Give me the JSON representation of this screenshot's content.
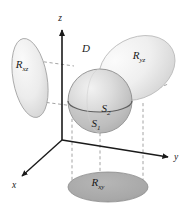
{
  "figure": {
    "title_present": false,
    "background_color": "#ffffff",
    "axes": {
      "z": {
        "label": "z",
        "label_x": 60,
        "label_y": 21,
        "arrow_dir": "up"
      },
      "y": {
        "label": "y",
        "label_x": 175,
        "label_y": 158,
        "arrow_dir": "right"
      },
      "x": {
        "label": "x",
        "label_x": 14,
        "label_y": 186,
        "arrow_dir": "down-left"
      }
    },
    "regions": [
      {
        "id": "R_xz",
        "name": "projection-xz",
        "base": "R",
        "sub": "xz",
        "label_x": 22,
        "label_y": 68,
        "fill": "#ededed",
        "stroke": "#9a9a9a",
        "cx": 30,
        "cy": 78,
        "rx": 17,
        "ry": 40,
        "rotate": -10
      },
      {
        "id": "R_yz",
        "name": "projection-yz",
        "base": "R",
        "sub": "yz",
        "label_x": 139,
        "label_y": 59,
        "fill": "#f0f0f0",
        "stroke": "#b4b4b4",
        "cx": 137,
        "cy": 68,
        "rx": 40,
        "ry": 30,
        "rotate": -28
      },
      {
        "id": "R_xy",
        "name": "projection-xy",
        "base": "R",
        "sub": "xy",
        "label_x": 98,
        "label_y": 186,
        "fill": "#a9a9a9",
        "stroke": "#8a8a8a",
        "cx": 108,
        "cy": 187,
        "rx": 40,
        "ry": 15,
        "rotate": 0
      }
    ],
    "solid": {
      "id": "D",
      "name": "solid-region-D",
      "label": "D",
      "label_x": 86,
      "label_y": 52,
      "cx": 100,
      "cy": 101,
      "r": 32,
      "fill_light": "#e6e6e6",
      "fill_dark": "#b8b8b8",
      "stroke": "#8c8c8c"
    },
    "surfaces": [
      {
        "id": "S_2",
        "name": "upper-surface-S2",
        "base": "S",
        "sub": "2",
        "label_x": 106,
        "label_y": 112,
        "description": "upper hemisphere surface"
      },
      {
        "id": "S_1",
        "name": "lower-surface-S1",
        "base": "S",
        "sub": "1",
        "label_x": 96,
        "label_y": 127,
        "description": "lower hemisphere surface"
      }
    ],
    "guide_lines": {
      "style": "dashed",
      "color": "#9a9a9a",
      "count": 6
    }
  }
}
